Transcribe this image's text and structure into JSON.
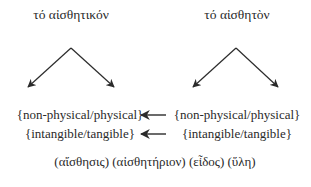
{
  "diagram": {
    "left": {
      "title": "τό αἰσθητικόν",
      "row1": "{non-physical/physical}",
      "row2": "{intangible/tangible}"
    },
    "right": {
      "title": "τό αἰσθητὸν",
      "row1": "{non-physical/physical}",
      "row2": "{intangible/tangible}"
    },
    "footer": "(αἴσθησις) (αἰσθητήριον) (εἶδος) (ὕλη)",
    "arrow_direction": "right-to-left",
    "colors": {
      "line": "#2b2b2b",
      "text": "#2a2a2a",
      "background": "#ffffff"
    }
  }
}
